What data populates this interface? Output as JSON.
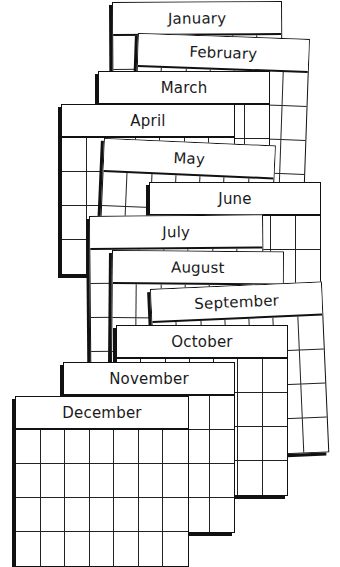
{
  "illustration": {
    "title": "Stacked monthly calendar pages",
    "colors": {
      "line": "#111111",
      "paper": "#ffffff",
      "text": "#1a1a1a"
    },
    "grid": {
      "columns": 7,
      "rows": 4
    },
    "months": [
      {
        "label": "January",
        "x": 112,
        "y": 2,
        "w": 168,
        "rot": -0.3
      },
      {
        "label": "February",
        "x": 138,
        "y": 33,
        "w": 170,
        "rot": 2.0
      },
      {
        "label": "March",
        "x": 98,
        "y": 71,
        "w": 170,
        "rot": 0
      },
      {
        "label": "April",
        "x": 61,
        "y": 104,
        "w": 172,
        "rot": 0
      },
      {
        "label": "May",
        "x": 104,
        "y": 138,
        "w": 170,
        "rot": 2.5
      },
      {
        "label": "June",
        "x": 149,
        "y": 182,
        "w": 170,
        "rot": 0
      },
      {
        "label": "July",
        "x": 89,
        "y": 216,
        "w": 172,
        "rot": -0.5
      },
      {
        "label": "August",
        "x": 112,
        "y": 250,
        "w": 170,
        "rot": 0.5
      },
      {
        "label": "September",
        "x": 150,
        "y": 289,
        "w": 170,
        "rot": -2.5
      },
      {
        "label": "October",
        "x": 116,
        "y": 325,
        "w": 170,
        "rot": 0
      },
      {
        "label": "November",
        "x": 63,
        "y": 362,
        "w": 170,
        "rot": 0
      },
      {
        "label": "December",
        "x": 15,
        "y": 396,
        "w": 172,
        "rot": 0
      }
    ]
  }
}
